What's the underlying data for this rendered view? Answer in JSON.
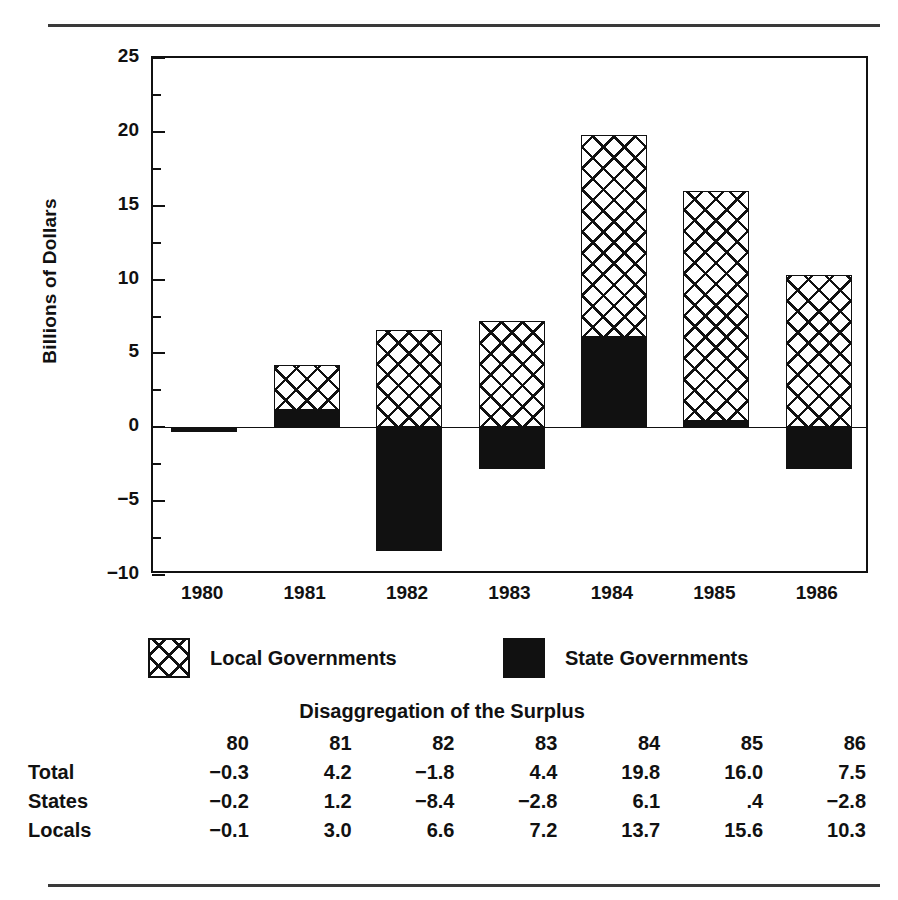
{
  "chart_data": {
    "type": "bar",
    "subtype": "stacked-bar-with-negatives",
    "title": "",
    "xlabel": "",
    "ylabel": "Billions of Dollars",
    "ylim": [
      -10,
      25
    ],
    "ytick_step": 5,
    "yticks": [
      "25",
      "20",
      "15",
      "10",
      "5",
      "0",
      "-5",
      "-10"
    ],
    "ytick_values": [
      25,
      20,
      15,
      10,
      5,
      0,
      -5,
      -10
    ],
    "minor_ticks": true,
    "grid": false,
    "legend_position": "below-axes",
    "categories": [
      "1980",
      "1981",
      "1982",
      "1983",
      "1984",
      "1985",
      "1986"
    ],
    "series": [
      {
        "name": "Local Governments",
        "pattern": "cross-hatch",
        "values": [
          -0.1,
          3.0,
          6.6,
          7.2,
          13.7,
          15.6,
          10.3
        ]
      },
      {
        "name": "State Governments",
        "pattern": "solid-black",
        "values": [
          -0.2,
          1.2,
          -8.4,
          -2.8,
          6.1,
          0.4,
          -2.8
        ]
      }
    ],
    "totals": [
      -0.3,
      4.2,
      -1.8,
      4.4,
      19.8,
      16.0,
      7.5
    ]
  },
  "axis": {
    "y_title": "Billions of Dollars",
    "ticks": [
      {
        "label": "25",
        "value": 25
      },
      {
        "label": "20",
        "value": 20
      },
      {
        "label": "15",
        "value": 15
      },
      {
        "label": "10",
        "value": 10
      },
      {
        "label": "5",
        "value": 5
      },
      {
        "label": "0",
        "value": 0
      },
      {
        "label": "−5",
        "value": -5
      },
      {
        "label": "−10",
        "value": -10
      }
    ],
    "x_labels": [
      "1980",
      "1981",
      "1982",
      "1983",
      "1984",
      "1985",
      "1986"
    ]
  },
  "legend": {
    "items": [
      {
        "label": "Local Governments",
        "swatch": "cross-hatch"
      },
      {
        "label": "State Governments",
        "swatch": "solid-black"
      }
    ]
  },
  "table": {
    "title": "Disaggregation of the Surplus",
    "columns": [
      "80",
      "81",
      "82",
      "83",
      "84",
      "85",
      "86"
    ],
    "rows": [
      {
        "label": "Total",
        "values": [
          "−0.3",
          "4.2",
          "−1.8",
          "4.4",
          "19.8",
          "16.0",
          "7.5"
        ]
      },
      {
        "label": "States",
        "values": [
          "−0.2",
          "1.2",
          "−8.4",
          "−2.8",
          "6.1",
          ".4",
          "−2.8"
        ]
      },
      {
        "label": "Locals",
        "values": [
          "−0.1",
          "3.0",
          "6.6",
          "7.2",
          "13.7",
          "15.6",
          "10.3"
        ]
      }
    ]
  },
  "colors": {
    "ink": "#111111",
    "rule": "#3a3a3a",
    "background": "#ffffff"
  }
}
